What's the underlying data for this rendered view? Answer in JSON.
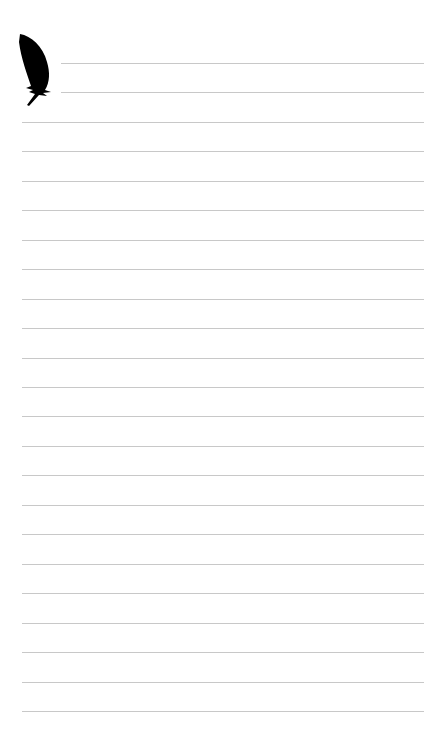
{
  "page": {
    "type": "lined-notepaper",
    "line_color": "#c8c8c8",
    "background": "#ffffff",
    "icon": "feather-icon",
    "short_lines": [
      63,
      92
    ],
    "full_lines": [
      122,
      151,
      181,
      210,
      240,
      269,
      299,
      328,
      358,
      387,
      416,
      446,
      475,
      505,
      534,
      564,
      593,
      623,
      652,
      682,
      711
    ]
  }
}
